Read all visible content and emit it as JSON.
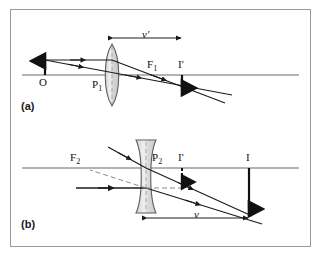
{
  "figure": {
    "type": "optics-ray-diagram",
    "panels": [
      {
        "id": "a",
        "panel_label": "(a)",
        "lens_type": "converging-biconvex",
        "labels": {
          "object": "O",
          "pole": "P",
          "pole_sub": "1",
          "focus": "F",
          "focus_sub": "1",
          "image": "I'",
          "distance": "v'"
        }
      },
      {
        "id": "b",
        "panel_label": "(b)",
        "lens_type": "diverging-biconcave",
        "labels": {
          "focus": "F",
          "focus_sub": "2",
          "pole": "P",
          "pole_sub": "2",
          "virtual_image": "I'",
          "object": "I",
          "distance": "v"
        }
      }
    ],
    "colors": {
      "frame": "#9a9a9a",
      "axis": "#9b9b9b",
      "ray": "#1a1a1a",
      "lens_fill": "#dcdcdc",
      "lens_stroke": "#6e6e6e",
      "arrow": "#111111",
      "dashed_ray": "#8a8a8a"
    }
  }
}
